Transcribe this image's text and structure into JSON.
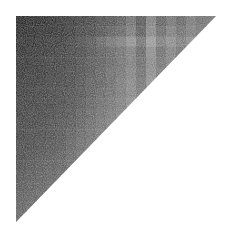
{
  "chart_data": {
    "type": "heatmap",
    "title": "",
    "xlabel": "",
    "ylabel": "",
    "shape": "upper-triangle",
    "colormap": "grayscale (dark = high value)",
    "bounds": {
      "left": 16,
      "top": 16,
      "right": 216,
      "bottom": 222
    },
    "n": 20,
    "legend": null,
    "values": [
      [
        0.92,
        0.9,
        0.9,
        0.88,
        0.86,
        0.84,
        0.82,
        0.8,
        0.76,
        0.74,
        0.7,
        0.62,
        0.72,
        0.55,
        0.68,
        0.6,
        0.66,
        0.58,
        0.62,
        0.6
      ],
      [
        0.9,
        0.9,
        0.88,
        0.88,
        0.86,
        0.84,
        0.8,
        0.78,
        0.74,
        0.7,
        0.66,
        0.58,
        0.7,
        0.52,
        0.64,
        0.56,
        0.62,
        0.56,
        0.6,
        0.58
      ],
      [
        0.88,
        0.88,
        0.86,
        0.84,
        0.84,
        0.8,
        0.76,
        0.72,
        0.66,
        0.6,
        0.56,
        0.48,
        0.6,
        0.44,
        0.56,
        0.5,
        0.56,
        0.5,
        0.54,
        0.52
      ],
      [
        0.88,
        0.86,
        0.86,
        0.84,
        0.82,
        0.8,
        0.78,
        0.74,
        0.7,
        0.66,
        0.62,
        0.56,
        0.66,
        0.5,
        0.62,
        0.54,
        0.6,
        0.54,
        0.58,
        0.56
      ],
      [
        0.86,
        0.86,
        0.84,
        0.82,
        0.82,
        0.8,
        0.76,
        0.72,
        0.7,
        0.66,
        0.62,
        0.56,
        0.64,
        0.52,
        0.6,
        0.54,
        0.58,
        0.54,
        0.56,
        0.56
      ],
      [
        0.86,
        0.84,
        0.84,
        0.82,
        0.8,
        0.78,
        0.76,
        0.72,
        0.68,
        0.64,
        0.6,
        0.54,
        0.62,
        0.5,
        0.58,
        0.52,
        0.56,
        0.52,
        0.54,
        0.54
      ],
      [
        0.84,
        0.84,
        0.82,
        0.8,
        0.8,
        0.78,
        0.74,
        0.7,
        0.68,
        0.64,
        0.58,
        0.52,
        0.6,
        0.48,
        0.56,
        0.5,
        0.54,
        0.5,
        0.52,
        0.52
      ],
      [
        0.84,
        0.82,
        0.82,
        0.8,
        0.78,
        0.76,
        0.74,
        0.7,
        0.66,
        0.62,
        0.58,
        0.52,
        0.58,
        0.48,
        0.54,
        0.5,
        0.52,
        0.5,
        0.5,
        0.5
      ],
      [
        0.82,
        0.82,
        0.8,
        0.8,
        0.78,
        0.76,
        0.72,
        0.68,
        0.64,
        0.6,
        0.56,
        0.5,
        0.56,
        0.46,
        0.52,
        0.48,
        0.5,
        0.48,
        0.48,
        0.48
      ],
      [
        0.82,
        0.8,
        0.8,
        0.78,
        0.76,
        0.74,
        0.7,
        0.66,
        0.62,
        0.58,
        0.54,
        0.48,
        0.54,
        0.44,
        0.5,
        0.46,
        0.48,
        0.46,
        0.46,
        0.46
      ],
      [
        0.8,
        0.8,
        0.78,
        0.76,
        0.74,
        0.72,
        0.68,
        0.64,
        0.6,
        0.56,
        0.52,
        0.46,
        0.52,
        0.42,
        0.48,
        0.44,
        0.46,
        0.44,
        0.44,
        0.44
      ],
      [
        0.8,
        0.78,
        0.78,
        0.76,
        0.74,
        0.7,
        0.66,
        0.62,
        0.58,
        0.54,
        0.5,
        0.46,
        0.5,
        0.42,
        0.46,
        0.42,
        0.44,
        0.42,
        0.42,
        0.42
      ],
      [
        0.78,
        0.78,
        0.76,
        0.74,
        0.72,
        0.68,
        0.64,
        0.6,
        0.56,
        0.52,
        0.48,
        0.44,
        0.48,
        0.4,
        0.44,
        0.4,
        0.42,
        0.4,
        0.4,
        0.4
      ],
      [
        0.78,
        0.76,
        0.74,
        0.72,
        0.7,
        0.66,
        0.62,
        0.58,
        0.54,
        0.5,
        0.46,
        0.42,
        0.46,
        0.4,
        0.42,
        0.4,
        0.4,
        0.4,
        0.4,
        0.4
      ],
      [
        0.76,
        0.74,
        0.72,
        0.7,
        0.68,
        0.64,
        0.6,
        0.56,
        0.52,
        0.48,
        0.44,
        0.4,
        0.44,
        0.38,
        0.4,
        0.38,
        0.38,
        0.38,
        0.38,
        0.38
      ],
      [
        0.74,
        0.72,
        0.7,
        0.68,
        0.66,
        0.62,
        0.58,
        0.54,
        0.5,
        0.46,
        0.42,
        0.38,
        0.42,
        0.36,
        0.38,
        0.36,
        0.36,
        0.36,
        0.36,
        0.36
      ],
      [
        0.72,
        0.7,
        0.68,
        0.66,
        0.64,
        0.6,
        0.56,
        0.52,
        0.48,
        0.44,
        0.4,
        0.36,
        0.4,
        0.34,
        0.36,
        0.34,
        0.34,
        0.34,
        0.34,
        0.34
      ],
      [
        0.7,
        0.68,
        0.66,
        0.64,
        0.62,
        0.58,
        0.54,
        0.5,
        0.46,
        0.42,
        0.38,
        0.34,
        0.38,
        0.32,
        0.34,
        0.32,
        0.32,
        0.32,
        0.32,
        0.32
      ],
      [
        0.68,
        0.66,
        0.64,
        0.62,
        0.6,
        0.56,
        0.52,
        0.48,
        0.44,
        0.4,
        0.36,
        0.32,
        0.36,
        0.3,
        0.32,
        0.3,
        0.3,
        0.3,
        0.3,
        0.3
      ],
      [
        0.66,
        0.64,
        0.62,
        0.6,
        0.58,
        0.54,
        0.5,
        0.46,
        0.42,
        0.38,
        0.34,
        0.3,
        0.34,
        0.28,
        0.3,
        0.28,
        0.28,
        0.28,
        0.28,
        0.28
      ]
    ]
  }
}
